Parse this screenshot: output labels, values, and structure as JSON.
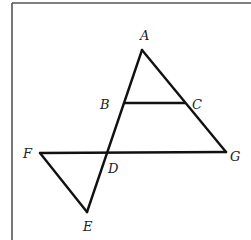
{
  "diagram": {
    "points": {
      "A": "A",
      "B": "B",
      "C": "C",
      "D": "D",
      "E": "E",
      "F": "F",
      "G": "G"
    },
    "segments": [
      {
        "name": "AE",
        "from": "A",
        "to": "E"
      },
      {
        "name": "AG",
        "from": "A",
        "to": "G"
      },
      {
        "name": "BC",
        "from": "B",
        "to": "C"
      },
      {
        "name": "FG",
        "from": "F",
        "to": "G"
      },
      {
        "name": "FE",
        "from": "F",
        "to": "E"
      }
    ]
  }
}
